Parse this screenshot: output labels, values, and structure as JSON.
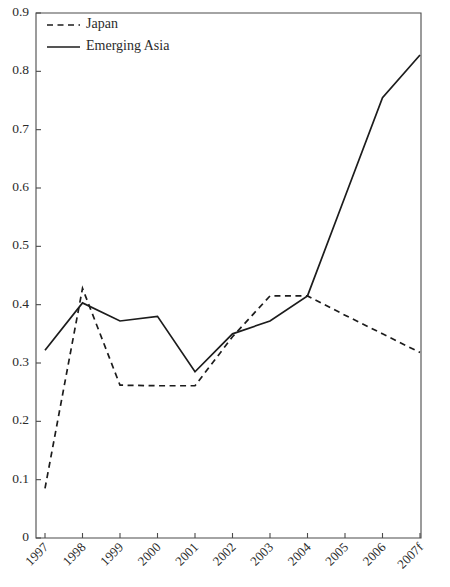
{
  "chart_data": {
    "type": "line",
    "title": "",
    "subtitle": "",
    "xlabel": "",
    "ylabel": "",
    "x": [
      "1997",
      "1998",
      "1999",
      "2000",
      "2001",
      "2002",
      "2003",
      "2004",
      "2005",
      "2006",
      "2007f"
    ],
    "categories": [
      "1997",
      "1998",
      "1999",
      "2000",
      "2001",
      "2002",
      "2003",
      "2004",
      "2005",
      "2006",
      "2007f"
    ],
    "series": [
      {
        "name": "Japan",
        "style": "dashed",
        "color": "#1c1c1c",
        "values": [
          0.085,
          0.428,
          0.262,
          0.261,
          0.261,
          0.345,
          0.415,
          0.415,
          0.382,
          0.35,
          0.318
        ]
      },
      {
        "name": "Emerging Asia",
        "style": "solid",
        "color": "#1c1c1c",
        "values": [
          0.322,
          0.403,
          0.372,
          0.38,
          0.285,
          0.35,
          0.372,
          0.415,
          0.585,
          0.755,
          0.828
        ]
      }
    ],
    "ylim": [
      0,
      0.9
    ],
    "ytick_values": [
      0,
      0.1,
      0.2,
      0.3,
      0.4,
      0.5,
      0.6,
      0.7,
      0.8,
      0.9
    ],
    "ytick_labels": [
      "0",
      "0.1",
      "0.2",
      "0.3",
      "0.4",
      "0.5",
      "0.6",
      "0.7",
      "0.8",
      "0.9"
    ],
    "grid": false,
    "legend_position": "top-left",
    "legend_entries": [
      "Japan",
      "Emerging Asia"
    ],
    "axis_color": "#4a4a4a",
    "xtick_rotation_deg": -45
  },
  "legend": {
    "japan_label": "Japan",
    "emerging_asia_label": "Emerging Asia"
  }
}
